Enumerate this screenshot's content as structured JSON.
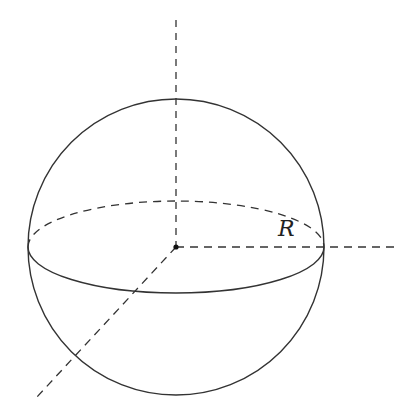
{
  "diagram": {
    "type": "sphere-with-axes",
    "labels": {
      "radius": "R"
    },
    "colors": {
      "stroke": "#333333",
      "background": "#ffffff"
    }
  }
}
